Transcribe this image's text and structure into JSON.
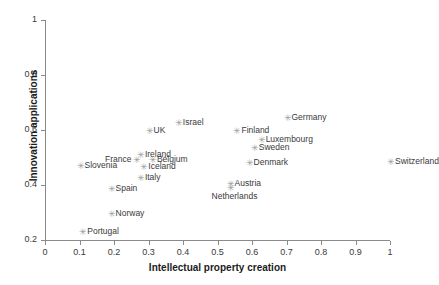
{
  "chart_data": {
    "type": "scatter",
    "title": "",
    "xlabel": "Intellectual property creation",
    "ylabel": "Innovation applications",
    "xlim": [
      0,
      1
    ],
    "ylim": [
      0.2,
      1
    ],
    "xticks": [
      "0",
      "0.1",
      "0.2",
      "0.3",
      "0.4",
      "0.5",
      "0.6",
      "0.7",
      "0.8",
      "0.9",
      "1"
    ],
    "xtick_values": [
      0,
      0.1,
      0.2,
      0.3,
      0.4,
      0.5,
      0.6,
      0.7,
      0.8,
      0.9,
      1
    ],
    "yticks": [
      "0.2",
      "0.4",
      "0.6",
      "0.8",
      "1"
    ],
    "ytick_values": [
      0.2,
      0.4,
      0.6,
      0.8,
      1
    ],
    "grid": false,
    "legend": false,
    "marker_color": "#9a9a9a",
    "label_color": "#3a3a3a",
    "axis_color": "#8a8a8a",
    "marker_glyph": "✳",
    "points": [
      {
        "label": "Switzerland",
        "x": 1.0,
        "y": 0.485,
        "label_pos": "right"
      },
      {
        "label": "Germany",
        "x": 0.7,
        "y": 0.645,
        "label_pos": "right"
      },
      {
        "label": "Israel",
        "x": 0.385,
        "y": 0.625,
        "label_pos": "right"
      },
      {
        "label": "Finland",
        "x": 0.555,
        "y": 0.595,
        "label_pos": "right"
      },
      {
        "label": "Luxembourg",
        "x": 0.625,
        "y": 0.565,
        "label_pos": "right"
      },
      {
        "label": "Sweden",
        "x": 0.605,
        "y": 0.535,
        "label_pos": "right"
      },
      {
        "label": "UK",
        "x": 0.3,
        "y": 0.595,
        "label_pos": "right"
      },
      {
        "label": "Denmark",
        "x": 0.59,
        "y": 0.48,
        "label_pos": "right"
      },
      {
        "label": "Ireland",
        "x": 0.275,
        "y": 0.51,
        "label_pos": "right"
      },
      {
        "label": "Belgium",
        "x": 0.31,
        "y": 0.49,
        "label_pos": "right"
      },
      {
        "label": "France",
        "x": 0.265,
        "y": 0.49,
        "label_pos": "left"
      },
      {
        "label": "Iceland",
        "x": 0.285,
        "y": 0.465,
        "label_pos": "right"
      },
      {
        "label": "Slovenia",
        "x": 0.1,
        "y": 0.47,
        "label_pos": "right"
      },
      {
        "label": "Italy",
        "x": 0.275,
        "y": 0.425,
        "label_pos": "right"
      },
      {
        "label": "Spain",
        "x": 0.19,
        "y": 0.385,
        "label_pos": "right"
      },
      {
        "label": "Austria",
        "x": 0.535,
        "y": 0.405,
        "label_pos": "right"
      },
      {
        "label": "Netherlands",
        "x": 0.535,
        "y": 0.39,
        "label_pos": "below"
      },
      {
        "label": "Norway",
        "x": 0.19,
        "y": 0.295,
        "label_pos": "right"
      },
      {
        "label": "Portugal",
        "x": 0.108,
        "y": 0.23,
        "label_pos": "right"
      }
    ]
  }
}
